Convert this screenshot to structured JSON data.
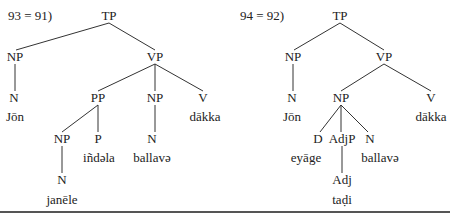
{
  "colors": {
    "text": "#222222",
    "line": "#333333",
    "rule": "#555555",
    "background": "#ffffff"
  },
  "trees": [
    {
      "example_label": "93 = 91)",
      "label_pos": [
        8,
        16
      ],
      "nodes": [
        {
          "id": "TP",
          "text": "TP",
          "x": 109,
          "y": 16
        },
        {
          "id": "NP1",
          "text": "NP",
          "x": 15,
          "y": 57
        },
        {
          "id": "VP",
          "text": "VP",
          "x": 155,
          "y": 57
        },
        {
          "id": "N1",
          "text": "N",
          "x": 14,
          "y": 98
        },
        {
          "id": "W1",
          "text": "Jōn",
          "x": 15,
          "y": 117
        },
        {
          "id": "PP",
          "text": "PP",
          "x": 98,
          "y": 98
        },
        {
          "id": "NP2",
          "text": "NP",
          "x": 155,
          "y": 98
        },
        {
          "id": "V",
          "text": "V",
          "x": 203,
          "y": 98
        },
        {
          "id": "W2",
          "text": "dākka",
          "x": 205,
          "y": 117
        },
        {
          "id": "NP3",
          "text": "NP",
          "x": 62,
          "y": 139
        },
        {
          "id": "P",
          "text": "P",
          "x": 98,
          "y": 139
        },
        {
          "id": "W3",
          "text": "iñdəla",
          "x": 99,
          "y": 158
        },
        {
          "id": "N2",
          "text": "N",
          "x": 152,
          "y": 139
        },
        {
          "id": "W4",
          "text": "ballavə",
          "x": 152,
          "y": 158
        },
        {
          "id": "N3",
          "text": "N",
          "x": 62,
          "y": 180
        },
        {
          "id": "W5",
          "text": "janēle",
          "x": 62,
          "y": 200
        }
      ],
      "edges": [
        [
          109,
          23,
          16,
          50
        ],
        [
          109,
          23,
          155,
          50
        ],
        [
          15,
          64,
          15,
          91
        ],
        [
          155,
          64,
          98,
          91
        ],
        [
          155,
          64,
          155,
          91
        ],
        [
          155,
          64,
          203,
          91
        ],
        [
          98,
          105,
          62,
          132
        ],
        [
          98,
          105,
          98,
          132
        ],
        [
          155,
          105,
          155,
          132
        ],
        [
          62,
          146,
          62,
          173
        ]
      ]
    },
    {
      "example_label": "94 = 92)",
      "label_pos": [
        240,
        16
      ],
      "nodes": [
        {
          "id": "TP",
          "text": "TP",
          "x": 340,
          "y": 16
        },
        {
          "id": "NP1",
          "text": "NP",
          "x": 293,
          "y": 57
        },
        {
          "id": "VP",
          "text": "VP",
          "x": 384,
          "y": 57
        },
        {
          "id": "N1",
          "text": "N",
          "x": 292,
          "y": 98
        },
        {
          "id": "W1",
          "text": "Jōn",
          "x": 292,
          "y": 117
        },
        {
          "id": "NP2",
          "text": "NP",
          "x": 341,
          "y": 98
        },
        {
          "id": "V",
          "text": "V",
          "x": 431,
          "y": 98
        },
        {
          "id": "W2",
          "text": "dākka",
          "x": 431,
          "y": 117
        },
        {
          "id": "D",
          "text": "D",
          "x": 318,
          "y": 139
        },
        {
          "id": "AdjP",
          "text": "AdjP",
          "x": 342,
          "y": 139
        },
        {
          "id": "N2",
          "text": "N",
          "x": 370,
          "y": 139
        },
        {
          "id": "W3",
          "text": "eyāge",
          "x": 306,
          "y": 158
        },
        {
          "id": "W4",
          "text": "ballavə",
          "x": 380,
          "y": 158
        },
        {
          "id": "Adj",
          "text": "Adj",
          "x": 342,
          "y": 180
        },
        {
          "id": "W5",
          "text": "taḍi",
          "x": 342,
          "y": 200
        }
      ],
      "edges": [
        [
          340,
          23,
          294,
          50
        ],
        [
          340,
          23,
          384,
          50
        ],
        [
          293,
          64,
          293,
          91
        ],
        [
          384,
          64,
          341,
          91
        ],
        [
          384,
          64,
          431,
          91
        ],
        [
          341,
          105,
          320,
          132
        ],
        [
          341,
          105,
          341,
          132
        ],
        [
          341,
          105,
          368,
          132
        ],
        [
          342,
          146,
          342,
          173
        ]
      ]
    }
  ]
}
